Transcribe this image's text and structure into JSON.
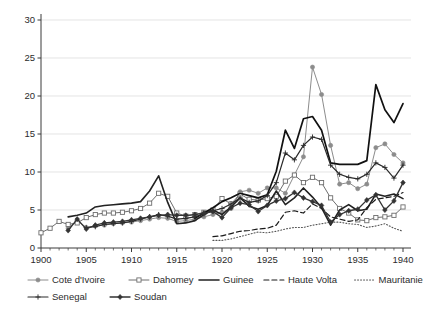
{
  "chart_data": {
    "type": "line",
    "title": "",
    "subtitle": "",
    "xlabel": "",
    "ylabel": "",
    "xlim": [
      1900,
      1940
    ],
    "ylim": [
      0,
      30
    ],
    "xticks": [
      1900,
      1905,
      1910,
      1915,
      1920,
      1925,
      1930,
      1935,
      1940
    ],
    "yticks": [
      0,
      5,
      10,
      15,
      20,
      25,
      30
    ],
    "xtick_labels": [
      "1900",
      "1905",
      "1910",
      "1915",
      "1920",
      "1925",
      "1930",
      "1935",
      "1940"
    ],
    "ytick_labels": [
      "0",
      "5",
      "10",
      "15",
      "20",
      "25",
      "30"
    ],
    "x_minor_tick_step": 1,
    "grid": "horizontal",
    "legend_position": "bottom",
    "series": [
      {
        "name": "Cote d'Ivoire",
        "color": "#8c8c8c",
        "marker": "filled-circle",
        "dash": "none",
        "width": 1.0,
        "x": [
          1903,
          1904,
          1905,
          1906,
          1907,
          1908,
          1909,
          1910,
          1911,
          1912,
          1913,
          1914,
          1915,
          1916,
          1917,
          1918,
          1919,
          1920,
          1921,
          1922,
          1923,
          1924,
          1925,
          1926,
          1927,
          1928,
          1929,
          1930,
          1931,
          1932,
          1933,
          1934,
          1935,
          1936,
          1937,
          1938,
          1939,
          1940
        ],
        "y": [
          2.6,
          3.6,
          2.7,
          2.9,
          3.0,
          3.2,
          3.3,
          3.4,
          3.6,
          3.8,
          4.0,
          3.9,
          3.5,
          3.6,
          3.8,
          4.1,
          4.4,
          4.7,
          5.2,
          7.4,
          7.6,
          7.2,
          7.9,
          7.9,
          7.2,
          9.6,
          12.0,
          23.8,
          20.2,
          13.5,
          8.4,
          8.6,
          7.8,
          8.4,
          13.2,
          13.7,
          12.3,
          11.2
        ]
      },
      {
        "name": "Dahomey",
        "color": "#6e6e6e",
        "marker": "open-square",
        "dash": "none",
        "width": 1.0,
        "x": [
          1900,
          1901,
          1902,
          1903,
          1904,
          1905,
          1906,
          1907,
          1908,
          1909,
          1910,
          1911,
          1912,
          1913,
          1914,
          1915,
          1916,
          1917,
          1918,
          1919,
          1920,
          1921,
          1922,
          1923,
          1924,
          1925,
          1926,
          1927,
          1928,
          1929,
          1930,
          1931,
          1932,
          1933,
          1934,
          1935,
          1936,
          1937,
          1938,
          1939,
          1940
        ],
        "y": [
          2.0,
          2.6,
          3.5,
          3.1,
          3.3,
          4.0,
          4.4,
          4.6,
          4.6,
          4.7,
          4.9,
          5.2,
          5.9,
          7.2,
          6.8,
          4.6,
          4.2,
          4.4,
          4.7,
          5.0,
          6.5,
          5.8,
          7.1,
          6.4,
          6.3,
          6.5,
          6.8,
          8.8,
          9.6,
          8.6,
          9.3,
          8.6,
          6.6,
          5.2,
          4.6,
          3.7,
          3.6,
          4.0,
          4.1,
          4.3,
          5.4
        ]
      },
      {
        "name": "Guinee",
        "color": "#222222",
        "marker": "none",
        "dash": "none",
        "width": 1.6,
        "x": [
          1903,
          1904,
          1905,
          1906,
          1907,
          1908,
          1909,
          1910,
          1911,
          1912,
          1913,
          1914,
          1915,
          1916,
          1917,
          1918,
          1919,
          1920,
          1921,
          1922,
          1923,
          1924,
          1925,
          1926,
          1927,
          1928,
          1929,
          1930,
          1931,
          1932,
          1933,
          1934,
          1935,
          1936,
          1937,
          1938,
          1939,
          1940
        ],
        "y": [
          4.1,
          4.3,
          4.6,
          5.4,
          5.6,
          5.7,
          5.8,
          5.9,
          6.1,
          7.5,
          9.5,
          6.0,
          3.2,
          3.3,
          3.6,
          4.4,
          5.0,
          4.4,
          5.4,
          6.6,
          5.5,
          5.1,
          5.6,
          7.5,
          5.7,
          6.6,
          7.9,
          6.7,
          5.3,
          3.0,
          5.0,
          5.7,
          4.9,
          5.1,
          7.1,
          6.8,
          7.1,
          6.5
        ]
      },
      {
        "name": "Haute Volta",
        "color": "#1a1a1a",
        "marker": "none",
        "dash": "5,3",
        "width": 1.2,
        "x": [
          1919,
          1920,
          1921,
          1922,
          1923,
          1924,
          1925,
          1926,
          1927,
          1928,
          1929,
          1930,
          1931,
          1932,
          1933,
          1934,
          1935,
          1936,
          1937,
          1938,
          1939,
          1940
        ],
        "y": [
          1.5,
          1.6,
          1.9,
          2.2,
          2.3,
          2.5,
          2.6,
          3.0,
          4.7,
          4.9,
          4.6,
          5.8,
          5.2,
          4.1,
          3.8,
          3.5,
          3.7,
          5.3,
          6.4,
          6.6,
          6.8,
          7.3
        ]
      },
      {
        "name": "Mauritanie",
        "color": "#555555",
        "marker": "none",
        "dash": "1,2",
        "width": 1.1,
        "x": [
          1919,
          1920,
          1921,
          1922,
          1923,
          1924,
          1925,
          1926,
          1927,
          1928,
          1929,
          1930,
          1931,
          1932,
          1933,
          1934,
          1935,
          1936,
          1937,
          1938,
          1939,
          1940
        ],
        "y": [
          1.0,
          1.0,
          1.2,
          1.5,
          1.8,
          2.1,
          2.0,
          2.2,
          2.5,
          2.7,
          2.7,
          3.0,
          3.2,
          3.4,
          3.4,
          3.2,
          3.1,
          2.7,
          2.9,
          3.2,
          2.6,
          2.2
        ]
      },
      {
        "name": "Niger",
        "color": "#111111",
        "marker": "none",
        "dash": "none",
        "width": 1.7,
        "x": [
          1917,
          1918,
          1919,
          1920,
          1921,
          1922,
          1923,
          1924,
          1925,
          1926,
          1927,
          1928,
          1929,
          1930,
          1931,
          1932,
          1933,
          1934,
          1935,
          1936,
          1937,
          1938,
          1939,
          1940
        ],
        "y": [
          3.9,
          4.6,
          5.3,
          6.1,
          6.6,
          7.2,
          6.9,
          6.6,
          7.0,
          10.1,
          15.5,
          13.1,
          17.0,
          17.3,
          15.5,
          11.2,
          11.0,
          11.0,
          11.0,
          11.5,
          21.5,
          18.2,
          16.5,
          19.0
        ]
      },
      {
        "name": "Senegal",
        "color": "#2a2a2a",
        "marker": "plus",
        "dash": "none",
        "width": 1.2,
        "x": [
          1905,
          1906,
          1907,
          1908,
          1909,
          1910,
          1911,
          1912,
          1913,
          1914,
          1915,
          1916,
          1917,
          1918,
          1919,
          1920,
          1921,
          1922,
          1923,
          1924,
          1925,
          1926,
          1927,
          1928,
          1929,
          1930,
          1931,
          1932,
          1933,
          1934,
          1935,
          1936,
          1937,
          1938,
          1939,
          1940
        ],
        "y": [
          2.7,
          2.8,
          3.1,
          3.2,
          3.3,
          3.5,
          3.8,
          4.1,
          4.4,
          4.2,
          3.8,
          3.9,
          4.1,
          4.5,
          4.9,
          5.2,
          5.8,
          6.6,
          6.0,
          6.2,
          6.9,
          8.6,
          12.5,
          11.6,
          13.5,
          14.6,
          14.3,
          10.9,
          9.7,
          9.3,
          9.1,
          9.7,
          11.2,
          10.6,
          9.2,
          10.9
        ]
      },
      {
        "name": "Soudan",
        "color": "#333333",
        "marker": "filled-diamond",
        "dash": "none",
        "width": 1.3,
        "x": [
          1903,
          1904,
          1905,
          1906,
          1907,
          1908,
          1909,
          1910,
          1911,
          1912,
          1913,
          1914,
          1915,
          1916,
          1917,
          1918,
          1919,
          1920,
          1921,
          1922,
          1923,
          1924,
          1925,
          1926,
          1927,
          1928,
          1929,
          1930,
          1931,
          1932,
          1933,
          1934,
          1935,
          1936,
          1937,
          1938,
          1939,
          1940
        ],
        "y": [
          2.3,
          3.8,
          2.5,
          3.0,
          3.3,
          3.4,
          3.5,
          3.7,
          3.9,
          4.1,
          4.3,
          4.4,
          4.3,
          4.3,
          4.4,
          4.6,
          4.8,
          4.0,
          5.3,
          5.9,
          5.7,
          4.8,
          5.6,
          6.2,
          6.5,
          7.3,
          6.6,
          6.1,
          5.6,
          3.4,
          4.4,
          4.9,
          5.1,
          6.3,
          7.0,
          5.0,
          6.2,
          8.6
        ]
      }
    ]
  },
  "legend": {
    "row1": [
      "Cote d'Ivoire",
      "Dahomey",
      "Guinee",
      "Haute Volta",
      "Mauritanie",
      "Niger"
    ],
    "row2": [
      "Senegal",
      "Soudan"
    ]
  }
}
